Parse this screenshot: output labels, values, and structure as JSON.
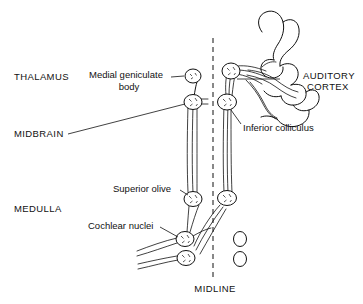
{
  "figure": {
    "background_color": "#ffffff",
    "ink_color": "#111111",
    "labels": {
      "thalamus": "THALAMUS",
      "midbrain": "MIDBRAIN",
      "medulla": "MEDULLA",
      "midline": "MIDLINE",
      "auditory_cortex_line1": "AUDITORY",
      "auditory_cortex_line2": "CORTEX",
      "medial_geniculate_line1": "Medial geniculate",
      "medial_geniculate_line2": "body",
      "inferior_colliculus": "Inferior colliculus",
      "superior_olive": "Superior olive",
      "cochlear_nuclei": "Cochlear nuclei"
    }
  }
}
